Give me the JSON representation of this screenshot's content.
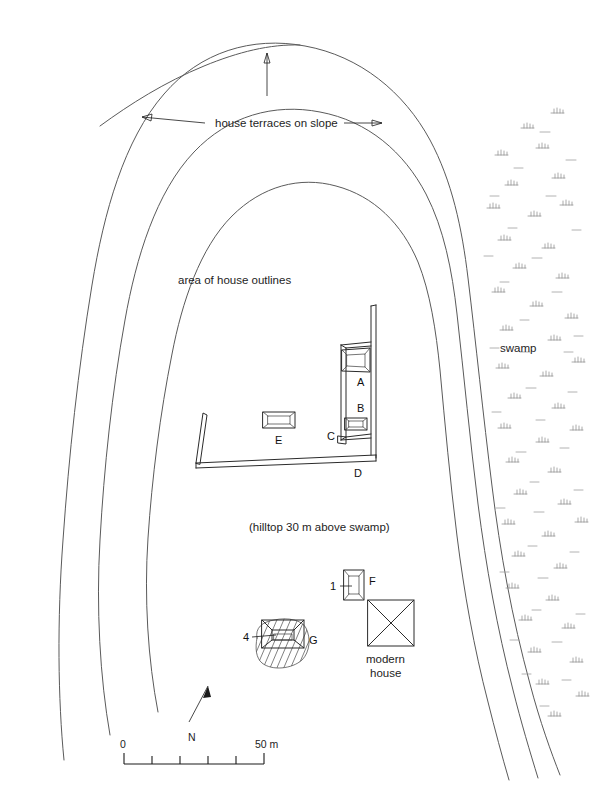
{
  "figure": {
    "type": "archaeological-site-plan",
    "background_color": "#ffffff",
    "contour_color": "#5a5a5a",
    "structure_color": "#2b2b2b",
    "swamp_color": "#8d8d8d"
  },
  "annotations": {
    "terraces_label": "house terraces on slope",
    "house_outlines_label": "area of house outlines",
    "hilltop_label": "(hilltop 30 m above swamp)",
    "swamp_label": "swamp",
    "modern_house_label_line1": "modern",
    "modern_house_label_line2": "house"
  },
  "structures": [
    {
      "id": "A",
      "label": "A",
      "label_x": 360,
      "label_y": 382,
      "kind": "platform-rectangular"
    },
    {
      "id": "B",
      "label": "B",
      "label_x": 360,
      "label_y": 412,
      "kind": "small-platform"
    },
    {
      "id": "C",
      "label": "C",
      "label_x": 330,
      "label_y": 438,
      "kind": "wall-corner"
    },
    {
      "id": "D",
      "label": "D",
      "label_x": 357,
      "label_y": 474,
      "kind": "long-wall"
    },
    {
      "id": "E",
      "label": "E",
      "label_x": 278,
      "label_y": 444,
      "kind": "small-platform"
    },
    {
      "id": "F",
      "label": "F",
      "label_x": 370,
      "label_y": 584,
      "kind": "small-platform"
    },
    {
      "id": "G",
      "label": "G",
      "label_x": 310,
      "label_y": 641,
      "kind": "platform-on-mound"
    }
  ],
  "excavation_marks": [
    {
      "id": "1",
      "label": "1",
      "label_x": 333,
      "label_y": 590,
      "attached_to": "F"
    },
    {
      "id": "4",
      "label": "4",
      "label_x": 246,
      "label_y": 640,
      "attached_to": "G"
    }
  ],
  "scale_bar": {
    "min_label": "0",
    "max_label": "50 m",
    "divisions": 5,
    "total_meters": 50,
    "units": "m"
  },
  "north_arrow": {
    "label": "N",
    "bearing_note": "arrow tilts slightly east of vertical"
  }
}
